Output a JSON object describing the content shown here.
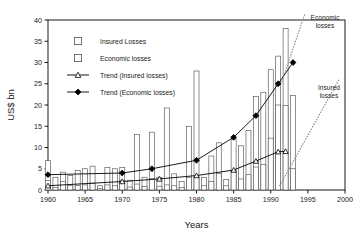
{
  "chart_data": {
    "type": "bar",
    "title": "",
    "xlabel": "Years",
    "ylabel": "US$ bn",
    "xlim": [
      1960,
      2000
    ],
    "ylim": [
      0,
      40
    ],
    "ytick_step": 5,
    "xtick_step": 5,
    "xticks": [
      "1960",
      "1965",
      "1970",
      "1975",
      "1980",
      "1985",
      "1990",
      "1995",
      "2000"
    ],
    "yticks": [
      "0",
      "5",
      "10",
      "15",
      "20",
      "25",
      "30",
      "35",
      "40"
    ],
    "grid": false,
    "legend_position": "upper-left-inside",
    "legend": [
      {
        "key": "insured_losses",
        "label": "Insured Losses",
        "marker": "open-square"
      },
      {
        "key": "economic_losses",
        "label": "Economic losses",
        "marker": "open-square"
      },
      {
        "key": "trend_insured",
        "label": "Trend (Insured losses)",
        "marker": "line-open-triangle"
      },
      {
        "key": "trend_economic",
        "label": "Trend (Economic losses)",
        "marker": "line-filled-diamond"
      }
    ],
    "years": [
      1960,
      1961,
      1962,
      1963,
      1964,
      1965,
      1966,
      1967,
      1968,
      1969,
      1970,
      1971,
      1972,
      1973,
      1974,
      1975,
      1976,
      1977,
      1978,
      1979,
      1980,
      1981,
      1982,
      1983,
      1984,
      1985,
      1986,
      1987,
      1988,
      1989,
      1990,
      1991,
      1992,
      1993
    ],
    "series": [
      {
        "name": "Economic losses",
        "values": [
          6.9,
          3.0,
          4.2,
          3.4,
          4.6,
          5.0,
          5.6,
          1.0,
          5.3,
          5.0,
          5.3,
          2.3,
          13.1,
          3.0,
          13.6,
          3.0,
          19.3,
          3.8,
          2.0,
          15.0,
          28.0,
          3.0,
          8.0,
          11.1,
          2.5,
          12.0,
          10.4,
          14.0,
          22.0,
          23.0,
          28.3,
          31.5,
          38.0,
          22.2
        ]
      },
      {
        "name": "Insured losses",
        "values": [
          2.2,
          0.6,
          2.0,
          1.0,
          1.1,
          1.2,
          1.6,
          0.3,
          1.2,
          1.0,
          2.2,
          0.7,
          1.4,
          0.8,
          2.7,
          0.9,
          1.2,
          1.0,
          0.6,
          3.0,
          3.0,
          1.0,
          2.0,
          3.9,
          1.0,
          4.4,
          2.6,
          3.6,
          5.4,
          6.0,
          12.2,
          20.0,
          19.9,
          5.0
        ]
      }
    ],
    "trend_insured": {
      "name": "Trend (Insured losses)",
      "points": [
        {
          "year": 1960,
          "value": 1.0
        },
        {
          "year": 1970,
          "value": 2.0
        },
        {
          "year": 1975,
          "value": 2.6
        },
        {
          "year": 1980,
          "value": 3.4
        },
        {
          "year": 1985,
          "value": 4.7
        },
        {
          "year": 1988,
          "value": 6.8
        },
        {
          "year": 1991,
          "value": 9.0
        },
        {
          "year": 1992,
          "value": 9.1
        }
      ]
    },
    "trend_economic": {
      "name": "Trend (Economic losses)",
      "points": [
        {
          "year": 1960,
          "value": 3.6
        },
        {
          "year": 1970,
          "value": 4.0
        },
        {
          "year": 1974,
          "value": 5.0
        },
        {
          "year": 1980,
          "value": 7.0
        },
        {
          "year": 1985,
          "value": 12.4
        },
        {
          "year": 1988,
          "value": 17.5
        },
        {
          "year": 1991,
          "value": 25.0
        },
        {
          "year": 1993,
          "value": 30.0
        }
      ]
    },
    "annotations": [
      {
        "key": "economic",
        "label_line1": "Economic",
        "label_line2": "losses",
        "style": "dotted-projection"
      },
      {
        "key": "insured",
        "label_line1": "Insured",
        "label_line2": "losses",
        "style": "dotted-projection"
      }
    ],
    "colors": {
      "axis": "#000000",
      "bar_stroke": "#555555",
      "bar_fill": "#ffffff",
      "trend": "#000000",
      "projection": "#888888",
      "background": "#ffffff"
    }
  }
}
